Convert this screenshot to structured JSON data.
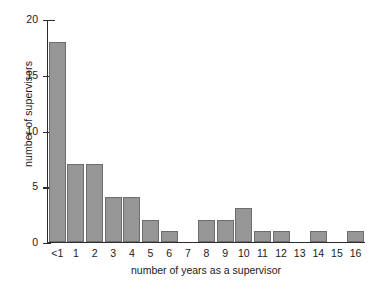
{
  "chart_data": {
    "type": "bar",
    "title": "",
    "xlabel": "number of years as a supervisor",
    "ylabel": "number of supervisors",
    "categories": [
      "<1",
      "1",
      "2",
      "3",
      "4",
      "5",
      "6",
      "7",
      "8",
      "9",
      "10",
      "11",
      "12",
      "13",
      "14",
      "15",
      "16"
    ],
    "values": [
      18,
      7,
      7,
      4,
      4,
      2,
      1,
      0,
      2,
      2,
      3,
      1,
      1,
      0,
      1,
      0,
      1
    ],
    "ylim": [
      0,
      20
    ],
    "yticks": [
      0,
      5,
      10,
      15,
      20
    ],
    "ytick_labels": [
      "0",
      "5",
      "10",
      "15",
      "20"
    ],
    "grid": false,
    "legend": false,
    "bar_color": "#969696",
    "bar_edge_color": "#6e6e6e",
    "axis_color": "#2b2b2b",
    "background": "#ffffff"
  }
}
